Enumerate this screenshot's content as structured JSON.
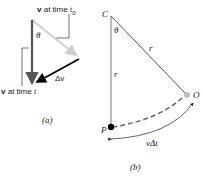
{
  "figure_a": {
    "caption": "(a)",
    "v_t0_label_prefix": "v",
    "v_t0_label_text": " at time ",
    "v_t0_label_var": "t",
    "v_t0_label_sub": "0",
    "v_t_label_prefix": "v",
    "v_t_label_text": " at time ",
    "v_t_label_var": "t",
    "theta": "θ",
    "delta_v": "Δv"
  },
  "figure_b": {
    "caption": "(b)",
    "point_C": "C",
    "point_O": "O",
    "point_P": "P",
    "theta": "θ",
    "radius_1": "r",
    "radius_2": "r",
    "arc_label": "vΔt"
  },
  "colors": {
    "dark_arrow": "#444444",
    "light_arrow": "#c8c8c8",
    "delta_arrow": "#000000",
    "radius_line": "#7a7a7a",
    "dashed_arc": "#777777"
  }
}
